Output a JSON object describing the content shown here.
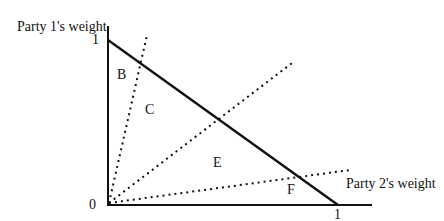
{
  "axes": {
    "y_label": "Party 1's weight",
    "x_label": "Party 2's weight",
    "y_tick_1": "1",
    "x_tick_1": "1",
    "origin": "0"
  },
  "regions": {
    "B": "B",
    "C": "C",
    "E": "E",
    "F": "F"
  },
  "lines": [
    {
      "type": "solid",
      "desc": "budget line from (0,1) to (1,0)"
    },
    {
      "type": "dotted",
      "desc": "steep ray from origin"
    },
    {
      "type": "dotted",
      "desc": "45-degree ray from origin"
    },
    {
      "type": "dotted",
      "desc": "shallow ray from origin"
    }
  ]
}
